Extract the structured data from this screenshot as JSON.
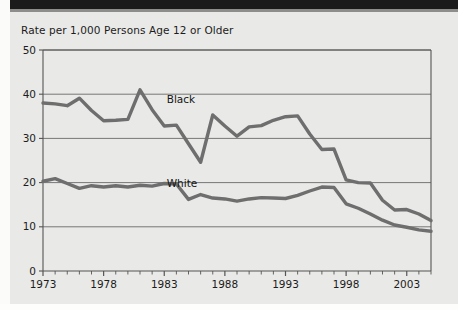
{
  "figure": {
    "title": "Rate per 1,000 Persons Age 12 or Older",
    "background_color": "#e9e9e7",
    "line_color": "#6e6e6e",
    "axis_color": "#555555"
  },
  "chart_data": {
    "type": "line",
    "title": "Rate per 1,000 Persons Age 12 or Older",
    "xlabel": "",
    "ylabel": "Rate per 1,000 Persons Age 12 or Older",
    "xlim": [
      1973,
      2005
    ],
    "ylim": [
      0,
      50
    ],
    "yticks": [
      0,
      10,
      20,
      30,
      40,
      50
    ],
    "xticks": [
      1973,
      1978,
      1983,
      1988,
      1993,
      1998,
      2003
    ],
    "xtick_labels": [
      "1973",
      "1978",
      "1983",
      "1988",
      "1993",
      "1998",
      "2003"
    ],
    "ytick_labels": [
      "0",
      "10",
      "20",
      "30",
      "40",
      "50"
    ],
    "grid": "horizontal",
    "legend": "inline-labels",
    "x": [
      1973,
      1974,
      1975,
      1976,
      1977,
      1978,
      1979,
      1980,
      1981,
      1982,
      1983,
      1984,
      1985,
      1986,
      1987,
      1988,
      1989,
      1990,
      1991,
      1992,
      1993,
      1994,
      1995,
      1996,
      1997,
      1998,
      1999,
      2000,
      2001,
      2002,
      2003,
      2004,
      2005
    ],
    "series": [
      {
        "name": "Black",
        "label": "Black",
        "values": [
          38.0,
          37.8,
          37.4,
          39.1,
          36.3,
          34.0,
          34.1,
          34.3,
          41.0,
          36.5,
          32.8,
          33.0,
          28.8,
          24.6,
          35.3,
          32.8,
          30.5,
          32.6,
          32.9,
          34.1,
          34.9,
          35.1,
          31.0,
          27.5,
          27.6,
          20.6,
          20.0,
          19.9,
          16.0,
          13.8,
          13.9,
          12.9,
          11.4
        ]
      },
      {
        "name": "White",
        "label": "White",
        "values": [
          20.3,
          20.9,
          19.8,
          18.7,
          19.3,
          19.0,
          19.3,
          19.0,
          19.4,
          19.2,
          19.8,
          19.7,
          16.2,
          17.3,
          16.5,
          16.3,
          15.8,
          16.3,
          16.6,
          16.5,
          16.4,
          17.1,
          18.1,
          19.0,
          18.9,
          15.2,
          14.2,
          12.9,
          11.5,
          10.4,
          9.9,
          9.3,
          9.0
        ]
      }
    ],
    "annotations": [
      {
        "text": "Black",
        "x": 1983.2,
        "y": 38.0
      },
      {
        "text": "White",
        "x": 1983.2,
        "y": 19.0
      }
    ]
  }
}
